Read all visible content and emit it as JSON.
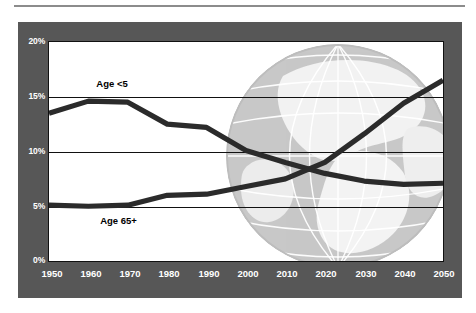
{
  "figure": {
    "background": "#ffffff",
    "frame_color": "#575757",
    "plot_background": "#ffffff",
    "line_color": "#2b2b2b",
    "gridline_color": "#111111",
    "axis_label_color": "#ffffff",
    "watermark": "globe-graphic"
  },
  "chart_data": {
    "type": "line",
    "title": "",
    "subtitle": "",
    "xlabel": "",
    "ylabel": "",
    "grid": true,
    "legend_position": "inline-annotation",
    "x": [
      1950,
      1960,
      1970,
      1980,
      1990,
      2000,
      2010,
      2020,
      2030,
      2040,
      2050
    ],
    "xtick_labels": [
      "1950",
      "1960",
      "1970",
      "1980",
      "1990",
      "2000",
      "2010",
      "2020",
      "2030",
      "2040",
      "2050"
    ],
    "xlim": [
      1950,
      2050
    ],
    "ytick_labels": [
      "0%",
      "5%",
      "10%",
      "15%",
      "20%"
    ],
    "ytick_values": [
      0,
      5,
      10,
      15,
      20
    ],
    "ylim": [
      0,
      20
    ],
    "series": [
      {
        "name": "Age <5",
        "label": "Age <5",
        "label_position": {
          "x": 1962,
          "y": 16.2
        },
        "values": [
          13.5,
          14.6,
          14.5,
          12.5,
          12.2,
          10.1,
          9.0,
          8.0,
          7.3,
          7.0,
          7.1
        ]
      },
      {
        "name": "Age 65+",
        "label": "Age 65+",
        "label_position": {
          "x": 1963,
          "y": 3.7
        },
        "values": [
          5.1,
          5.0,
          5.1,
          6.0,
          6.1,
          6.8,
          7.5,
          9.0,
          11.6,
          14.4,
          16.5
        ]
      }
    ]
  }
}
